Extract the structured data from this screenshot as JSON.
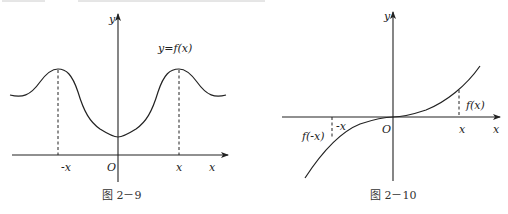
{
  "figures": [
    {
      "id": "fig-2-9",
      "caption": "图 2－9",
      "function_label": "y=f(x)",
      "axis_labels": {
        "x": "x",
        "y": "y",
        "origin": "O"
      },
      "tick_labels": [
        "-x",
        "x"
      ],
      "description": "Even function graph symmetric about y-axis, with dashed lines at -x and x marking equal peaks"
    },
    {
      "id": "fig-2-10",
      "caption": "图 2－10",
      "axis_labels": {
        "x": "x",
        "y": "y",
        "origin": "O"
      },
      "tick_labels": [
        "-x",
        "x"
      ],
      "value_labels": [
        "f(-x)",
        "f(x)"
      ],
      "description": "Odd function graph symmetric about origin, with dashed lines showing f(x) and f(-x)"
    }
  ]
}
